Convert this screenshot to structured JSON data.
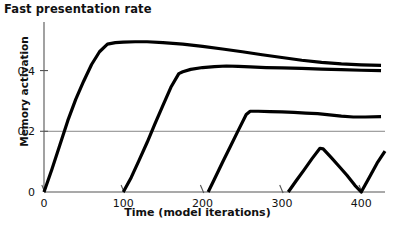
{
  "chart_data": {
    "type": "line",
    "title": "Fast presentation rate",
    "xlabel": "Time (model iterations)",
    "ylabel": "Memory activation",
    "xlim": [
      0,
      430
    ],
    "ylim": [
      0,
      0.56
    ],
    "xticks": [
      0,
      100,
      200,
      300,
      400
    ],
    "xtick_labels": [
      "0",
      "100",
      "200",
      "300",
      "400"
    ],
    "yticks": [
      0,
      0.2,
      0.4
    ],
    "ytick_labels": [
      "0",
      "0.2",
      "0.4"
    ],
    "grid": "horizontal gridline at y=0.2 only",
    "legend": "none",
    "series": [
      {
        "name": "item-1",
        "onset": 0,
        "x": [
          0,
          10,
          20,
          30,
          40,
          50,
          60,
          70,
          80,
          90,
          100,
          115,
          130,
          150,
          175,
          200,
          225,
          250,
          275,
          300,
          325,
          350,
          375,
          400,
          425
        ],
        "y": [
          0.0,
          0.075,
          0.155,
          0.235,
          0.305,
          0.365,
          0.42,
          0.462,
          0.487,
          0.492,
          0.494,
          0.495,
          0.495,
          0.492,
          0.487,
          0.48,
          0.471,
          0.462,
          0.452,
          0.443,
          0.434,
          0.427,
          0.422,
          0.419,
          0.417
        ]
      },
      {
        "name": "item-2",
        "onset": 100,
        "x": [
          100,
          110,
          120,
          130,
          140,
          150,
          160,
          170,
          175,
          185,
          200,
          215,
          230,
          245,
          260,
          280,
          300,
          325,
          350,
          375,
          400,
          425
        ],
        "y": [
          0.0,
          0.048,
          0.105,
          0.163,
          0.225,
          0.285,
          0.345,
          0.39,
          0.396,
          0.404,
          0.41,
          0.413,
          0.415,
          0.414,
          0.412,
          0.41,
          0.409,
          0.407,
          0.405,
          0.403,
          0.401,
          0.4
        ]
      },
      {
        "name": "item-3",
        "onset": 207,
        "x": [
          207,
          215,
          225,
          235,
          245,
          255,
          260,
          270,
          285,
          300,
          315,
          330,
          345,
          360,
          375,
          390,
          405,
          425
        ],
        "y": [
          0.0,
          0.043,
          0.097,
          0.15,
          0.203,
          0.255,
          0.266,
          0.266,
          0.265,
          0.264,
          0.262,
          0.26,
          0.258,
          0.254,
          0.25,
          0.247,
          0.247,
          0.248
        ]
      },
      {
        "name": "item-4",
        "onset": 308,
        "x": [
          308,
          318,
          328,
          338,
          348,
          352,
          362,
          372,
          382,
          392,
          400,
          410,
          420,
          430
        ],
        "y": [
          0.0,
          0.037,
          0.073,
          0.11,
          0.144,
          0.142,
          0.114,
          0.085,
          0.055,
          0.022,
          0.0,
          0.047,
          0.095,
          0.135
        ]
      }
    ]
  },
  "colors": {
    "line": "#000000",
    "axis": "#555555",
    "grid": "#888888",
    "text": "#111111",
    "background": "#ffffff"
  }
}
